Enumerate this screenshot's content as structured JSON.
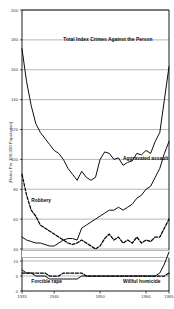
{
  "chart_data": {
    "type": "line",
    "title": "",
    "xlabel": "",
    "ylabel": "(Rates Per 100,000 Population)",
    "grid": true,
    "legend_position": "inline-annotations",
    "axis_note": "y-axis has a break between 40 and 10",
    "xlim": [
      1933,
      1965
    ],
    "x_tick_labels": [
      "1933",
      "1940",
      "1950",
      "1960",
      "1965"
    ],
    "x_ticks": [
      1933,
      1940,
      1950,
      1960,
      1965
    ],
    "y_tick_labels": [
      "200",
      "180",
      "160",
      "140",
      "120",
      "100",
      "80",
      "60",
      "40",
      "10",
      "5",
      "0"
    ],
    "y_ticks_upper": [
      200,
      180,
      160,
      140,
      120,
      100,
      80,
      60,
      40
    ],
    "y_ticks_lower": [
      10,
      5,
      0
    ],
    "x": [
      1933,
      1934,
      1935,
      1936,
      1937,
      1938,
      1939,
      1940,
      1941,
      1942,
      1943,
      1944,
      1945,
      1946,
      1947,
      1948,
      1949,
      1950,
      1951,
      1952,
      1953,
      1954,
      1955,
      1956,
      1957,
      1958,
      1959,
      1960,
      1961,
      1962,
      1963,
      1964,
      1965
    ],
    "series": [
      {
        "name": "Total Index Crimes Against the Person",
        "style": "solid",
        "values": [
          174,
          152,
          136,
          124,
          118,
          114,
          110,
          106,
          104,
          100,
          94,
          90,
          86,
          92,
          88,
          86,
          88,
          100,
          105,
          104,
          100,
          101,
          96,
          98,
          99,
          104,
          103,
          106,
          104,
          112,
          118,
          140,
          162
        ]
      },
      {
        "name": "Aggravated assault",
        "style": "solid",
        "values": [
          48,
          46,
          45,
          44,
          44,
          43,
          42,
          42,
          44,
          46,
          47,
          47,
          46,
          54,
          56,
          58,
          60,
          62,
          64,
          66,
          66,
          68,
          66,
          68,
          70,
          74,
          76,
          80,
          82,
          88,
          94,
          104,
          112
        ]
      },
      {
        "name": "Robbery",
        "style": "dashed",
        "values": [
          90,
          76,
          66,
          62,
          56,
          54,
          52,
          50,
          48,
          46,
          44,
          43,
          44,
          46,
          44,
          42,
          40,
          42,
          47,
          50,
          46,
          48,
          44,
          46,
          44,
          48,
          44,
          46,
          45,
          48,
          48,
          54,
          60
        ]
      },
      {
        "name": "Forcible rape",
        "style": "dashed",
        "values": [
          6,
          6,
          6,
          6,
          6,
          6,
          5,
          5,
          5,
          6,
          6,
          6,
          6,
          6,
          5,
          5,
          5,
          5,
          5,
          5,
          5,
          5,
          5,
          5,
          5,
          5,
          5,
          5,
          5,
          5,
          5,
          5,
          6
        ]
      },
      {
        "name": "Willful homicide",
        "style": "solid",
        "values": [
          7,
          6,
          6,
          5,
          5,
          5,
          4,
          4,
          4,
          4,
          4,
          4,
          4,
          5,
          5,
          5,
          5,
          5,
          5,
          5,
          5,
          5,
          5,
          5,
          5,
          5,
          5,
          5,
          5,
          5,
          6,
          9,
          13
        ]
      }
    ],
    "annotations": [
      {
        "text": "Total Index Crimes Against the Person",
        "x": 1942,
        "y": 180
      },
      {
        "text": "Aggravated assault",
        "x": 1955,
        "y": 100
      },
      {
        "text": "Robbery",
        "x": 1935,
        "y": 72
      },
      {
        "text": "Forcible rape",
        "x": 1935,
        "y": 3
      },
      {
        "text": "Willful homicide",
        "x": 1955,
        "y": 3
      }
    ]
  },
  "colors": {
    "line": "#000000",
    "grid": "#888888",
    "axis": "#000000",
    "text": "#2b2b2b"
  }
}
